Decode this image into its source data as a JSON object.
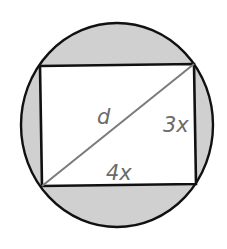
{
  "diagram": {
    "labels": {
      "diagonal": "d",
      "height": "3x",
      "width": "4x"
    },
    "colors": {
      "shaded_region": "#d0d0d0",
      "outline": "#111111",
      "diagonal": "#7a7a7a",
      "label_text": "#6b6b6b",
      "rectangle_fill": "#ffffff"
    }
  }
}
